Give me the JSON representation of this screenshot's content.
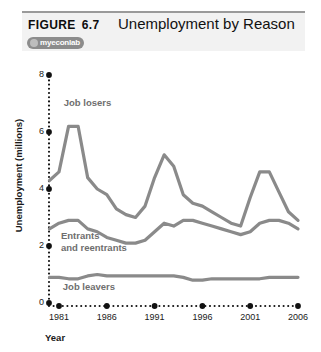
{
  "figure": {
    "label": "FIGURE",
    "number": "6.7",
    "title": "Unemployment by Reason",
    "logo": {
      "text": "myeconlab",
      "icon": "myeconlab-logo-icon"
    }
  },
  "chart_data": {
    "type": "line",
    "title": "Unemployment by Reason",
    "xlabel": "Year",
    "ylabel": "Unemployment (millions)",
    "xlim": [
      1980,
      2006
    ],
    "ylim": [
      0,
      8
    ],
    "xticks": [
      1981,
      1986,
      1991,
      1996,
      2001,
      2006
    ],
    "yticks": [
      0,
      2,
      4,
      6,
      8
    ],
    "grid": false,
    "legend": "inline-annotations",
    "x": [
      1980,
      1981,
      1982,
      1983,
      1984,
      1985,
      1986,
      1987,
      1988,
      1989,
      1990,
      1991,
      1992,
      1993,
      1994,
      1995,
      1996,
      1997,
      1998,
      1999,
      2000,
      2001,
      2002,
      2003,
      2004,
      2005,
      2006
    ],
    "series": [
      {
        "name": "Job losers",
        "color": "#8a8a8a",
        "values": [
          4.3,
          4.6,
          6.2,
          6.2,
          4.4,
          4.0,
          3.8,
          3.3,
          3.1,
          3.0,
          3.4,
          4.4,
          5.2,
          4.8,
          3.8,
          3.5,
          3.4,
          3.2,
          3.0,
          2.8,
          2.7,
          3.7,
          4.6,
          4.6,
          3.9,
          3.2,
          2.9
        ]
      },
      {
        "name": "Entrants and reentrants",
        "color": "#8a8a8a",
        "values": [
          2.6,
          2.8,
          2.9,
          2.9,
          2.6,
          2.5,
          2.3,
          2.2,
          2.1,
          2.1,
          2.2,
          2.5,
          2.8,
          2.7,
          2.9,
          2.9,
          2.8,
          2.7,
          2.6,
          2.5,
          2.4,
          2.5,
          2.8,
          2.9,
          2.9,
          2.8,
          2.6
        ]
      },
      {
        "name": "Job leavers",
        "color": "#8a8a8a",
        "values": [
          0.9,
          0.9,
          0.85,
          0.85,
          0.95,
          1.0,
          0.95,
          0.95,
          0.95,
          0.95,
          0.95,
          0.95,
          0.95,
          0.95,
          0.9,
          0.8,
          0.8,
          0.85,
          0.85,
          0.85,
          0.85,
          0.85,
          0.85,
          0.9,
          0.9,
          0.9,
          0.9
        ]
      }
    ],
    "annotations": [
      {
        "text": "Job losers",
        "x": 1981.5,
        "y": 6.9
      },
      {
        "text": "Entrants",
        "x": 1981.2,
        "y": 2.25
      },
      {
        "text": "and reentrants",
        "x": 1981.2,
        "y": 1.82
      },
      {
        "text": "Job leavers",
        "x": 1981.4,
        "y": 0.45
      }
    ]
  }
}
